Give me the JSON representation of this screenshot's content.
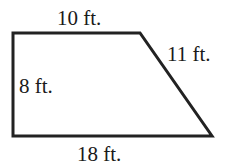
{
  "diagram": {
    "type": "trapezoid",
    "stroke_color": "#222222",
    "stroke_width": 3,
    "vertices": [
      [
        13,
        33
      ],
      [
        140,
        33
      ],
      [
        212,
        136
      ],
      [
        13,
        136
      ]
    ],
    "labels": {
      "top": "10 ft.",
      "slant": "11 ft.",
      "left": "8 ft.",
      "bottom": "18 ft."
    },
    "dimensions": {
      "top_base_ft": 10,
      "bottom_base_ft": 18,
      "height_ft": 8,
      "slanted_side_ft": 11
    }
  }
}
